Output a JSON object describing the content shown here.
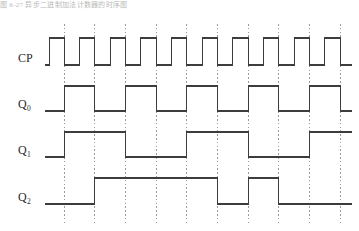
{
  "figure": {
    "title_strip": "图 6-27 异步二进制加法计数器的时序图",
    "background_color": "#ffffff",
    "wave_color": "#3d3d3d",
    "grid_color": "#9a9a9a",
    "type": "digital-timing-diagram"
  },
  "axis": {
    "x_start": 45,
    "x_end": 352,
    "clock_period_px": 30.6,
    "half_period_px": 15.3,
    "clock_cycles": 10,
    "gridline_count": 10,
    "gridline_x": [
      64,
      94,
      125,
      156,
      186,
      217,
      248,
      278,
      309,
      340
    ],
    "gridline_y_top": 14,
    "gridline_y_bottom": 215
  },
  "signals": [
    {
      "name": "CP",
      "label": "CP",
      "subscript": "",
      "baseline_y": 55,
      "high_y": 28,
      "starts_low": true,
      "description": "clock pulse train, 10 cycles, falling edges aligned to gridlines",
      "transitions_px": [
        49,
        64,
        79,
        94,
        110,
        125,
        140,
        156,
        171,
        186,
        202,
        217,
        232,
        248,
        263,
        278,
        294,
        309,
        324,
        340
      ]
    },
    {
      "name": "Q0",
      "label": "Q",
      "subscript": "0",
      "baseline_y": 101,
      "high_y": 76,
      "starts_low": true,
      "description": "toggles on every CP falling edge; half clock frequency",
      "transitions_px": [
        64,
        94,
        125,
        156,
        186,
        217,
        248,
        278,
        309,
        340
      ]
    },
    {
      "name": "Q1",
      "label": "Q",
      "subscript": "1",
      "baseline_y": 147,
      "high_y": 122,
      "starts_low": true,
      "description": "toggles on every falling edge of Q0; quarter clock frequency",
      "transitions_px": [
        64,
        125,
        186,
        248,
        309
      ]
    },
    {
      "name": "Q2",
      "label": "Q",
      "subscript": "2",
      "baseline_y": 194,
      "high_y": 168,
      "starts_low": true,
      "description": "toggles on falling edges of Q1 with glitch pulse near end",
      "transitions_px": [
        94,
        217,
        248,
        278
      ]
    }
  ],
  "labels": {
    "cp": "CP",
    "q0_base": "Q",
    "q0_sub": "0",
    "q1_base": "Q",
    "q1_sub": "1",
    "q2_base": "Q",
    "q2_sub": "2"
  }
}
